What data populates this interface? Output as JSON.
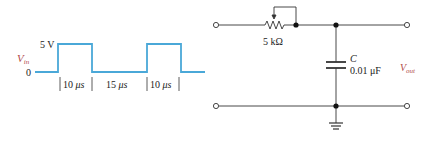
{
  "waveform": {
    "label": "V",
    "label_sub": "in",
    "high_label": "5 V",
    "low_label": "0",
    "intervals": [
      {
        "num": "10",
        "unit": "μs"
      },
      {
        "num": "15",
        "unit": "μs"
      },
      {
        "num": "10",
        "unit": "μs"
      }
    ],
    "color": "#4aa8d8"
  },
  "circuit": {
    "resistor_label": "5 kΩ",
    "capacitor_name": "C",
    "capacitor_value": "0.01 μF",
    "output_label": "V",
    "output_sub": "out",
    "wire_color": "#333333",
    "label_color": "#b04a4a"
  }
}
